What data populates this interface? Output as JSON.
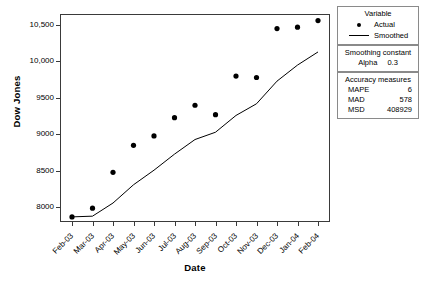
{
  "chart_data": {
    "type": "scatter",
    "title": "",
    "xlabel": "Date",
    "ylabel": "Dow Jones",
    "categories": [
      "Feb-03",
      "Mar-03",
      "Apr-03",
      "May-03",
      "Jun-03",
      "Jul-03",
      "Aug-03",
      "Sep-03",
      "Oct-03",
      "Nov-03",
      "Dec-03",
      "Jan-04",
      "Feb-04"
    ],
    "ylim": [
      7800,
      10650
    ],
    "yticks": [
      8000,
      8500,
      9000,
      9500,
      10000,
      10500
    ],
    "ytick_labels": [
      "8000",
      "8500",
      "9000",
      "9500",
      "10,000",
      "10,500"
    ],
    "grid": false,
    "legend_position": "right",
    "series": [
      {
        "name": "Actual",
        "marker": "filled-circle",
        "color": "#000000",
        "values": [
          7870,
          7990,
          8480,
          8850,
          8980,
          9230,
          9400,
          9270,
          9800,
          9780,
          10450,
          10470,
          10560
        ]
      },
      {
        "name": "Smoothed",
        "marker": "line",
        "color": "#000000",
        "values": [
          7870,
          7880,
          8060,
          8310,
          8510,
          8730,
          8930,
          9030,
          9260,
          9420,
          9730,
          9950,
          10130
        ]
      }
    ]
  },
  "legend": {
    "title": "Variable",
    "items": [
      {
        "label": "Actual",
        "key": "dot"
      },
      {
        "label": "Smoothed",
        "key": "line"
      }
    ]
  },
  "smoothing": {
    "title": "Smoothing constant",
    "alpha_label": "Alpha",
    "alpha_value": "0.3"
  },
  "accuracy": {
    "title": "Accuracy measures",
    "rows": [
      {
        "key": "MAPE",
        "value": "6"
      },
      {
        "key": "MAD",
        "value": "578"
      },
      {
        "key": "MSD",
        "value": "408929"
      }
    ]
  }
}
